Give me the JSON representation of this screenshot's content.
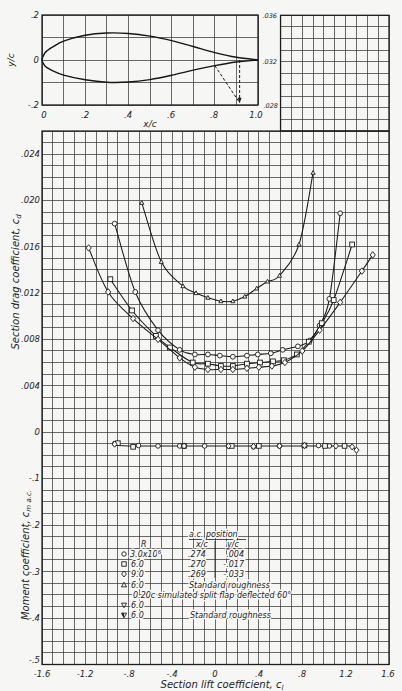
{
  "figure": {
    "airfoil": {
      "ylabel": "y/c",
      "xlabel": "x/c",
      "xticks": [
        "0",
        ".2",
        ".4",
        ".6",
        ".8",
        "1.0"
      ],
      "yticks": [
        ".2",
        "0",
        "-.2"
      ]
    },
    "extension_ticks": [
      ".036",
      ".032",
      ".028"
    ],
    "drag": {
      "ylabel": "Section drag coefficient, c",
      "ylabel_sub": "d",
      "yticks": [
        ".024",
        ".020",
        ".016",
        ".012",
        ".008",
        ".004",
        "0"
      ]
    },
    "moment": {
      "ylabel": "Moment coefficient, c",
      "ylabel_sub": "m a.c.",
      "yticks": [
        "-.1",
        "-.2",
        "-.3",
        "-.4",
        "-.5"
      ]
    },
    "xaxis": {
      "label": "Section lift coefficient, c",
      "label_sub": "l",
      "ticks": [
        "-1.6",
        "-1.2",
        "-.8",
        "-.4",
        "0",
        ".4",
        ".8",
        "1.2",
        "1.6"
      ]
    },
    "legend": {
      "header_ac": "a.c. position",
      "header_r": "R",
      "header_xc": "x/c",
      "header_yc": "y/c",
      "rows": [
        {
          "marker": "circle",
          "r": "3.0x10",
          "r_exp": "6",
          "xc": ".274",
          "yc": ".004"
        },
        {
          "marker": "square",
          "r": "6.0",
          "xc": ".270",
          "yc": "-.017"
        },
        {
          "marker": "diamond",
          "r": "9.0",
          "xc": ".269",
          "yc": "-.033"
        },
        {
          "marker": "triangle",
          "r": "6.0",
          "note": "Standard roughness"
        },
        {
          "note": "0.20c simulated split flap deflected 60°"
        },
        {
          "marker": "triangle-down",
          "r": "6.0"
        },
        {
          "marker": "triangle-down-flagged",
          "r": "6.0",
          "note": "Standard roughness"
        }
      ]
    }
  },
  "chart_data": [
    {
      "type": "line",
      "title": "Airfoil section",
      "xlabel": "x/c",
      "ylabel": "y/c",
      "xlim": [
        0,
        1.0
      ],
      "ylim": [
        -0.2,
        0.2
      ],
      "xticks": [
        0,
        0.2,
        0.4,
        0.6,
        0.8,
        1.0
      ],
      "yticks": [
        -0.2,
        0,
        0.2
      ],
      "grid": true,
      "series": [
        {
          "name": "upper surface",
          "points": [
            [
              0,
              0
            ],
            [
              0.0125,
              0.03
            ],
            [
              0.025,
              0.042
            ],
            [
              0.05,
              0.058
            ],
            [
              0.1,
              0.084
            ],
            [
              0.2,
              0.11
            ],
            [
              0.3,
              0.12
            ],
            [
              0.4,
              0.118
            ],
            [
              0.5,
              0.106
            ],
            [
              0.6,
              0.086
            ],
            [
              0.7,
              0.06
            ],
            [
              0.8,
              0.033
            ],
            [
              0.9,
              0.012
            ],
            [
              1.0,
              0
            ]
          ]
        },
        {
          "name": "lower surface",
          "points": [
            [
              0,
              0
            ],
            [
              0.0125,
              -0.025
            ],
            [
              0.025,
              -0.035
            ],
            [
              0.05,
              -0.048
            ],
            [
              0.1,
              -0.067
            ],
            [
              0.2,
              -0.088
            ],
            [
              0.3,
              -0.099
            ],
            [
              0.4,
              -0.098
            ],
            [
              0.5,
              -0.087
            ],
            [
              0.6,
              -0.068
            ],
            [
              0.7,
              -0.045
            ],
            [
              0.8,
              -0.025
            ],
            [
              0.9,
              -0.009
            ],
            [
              1.0,
              0
            ]
          ]
        },
        {
          "name": "split flap deflected 60 deg",
          "style": "dashed",
          "points": [
            [
              0.8,
              -0.025
            ],
            [
              0.915,
              -0.19
            ]
          ]
        },
        {
          "name": "flap reference",
          "style": "dashed-arrow",
          "points": [
            [
              0.915,
              0
            ],
            [
              0.915,
              -0.19
            ]
          ]
        }
      ]
    },
    {
      "type": "line",
      "title": "Section drag coefficient vs section lift coefficient",
      "xlabel": "Section lift coefficient, cl",
      "ylabel": "Section drag coefficient, cd",
      "xlim": [
        -1.6,
        1.6
      ],
      "ylim": [
        0,
        0.036
      ],
      "xticks": [
        -1.6,
        -1.2,
        -0.8,
        -0.4,
        0,
        0.4,
        0.8,
        1.2,
        1.6
      ],
      "yticks": [
        0,
        0.004,
        0.008,
        0.012,
        0.016,
        0.02,
        0.024,
        0.028,
        0.032,
        0.036
      ],
      "grid": true,
      "legend_position": "lower center (inside moment panel)",
      "series": [
        {
          "name": "R = 3.0x10^6",
          "marker": "circle",
          "points": [
            [
              -0.93,
              0.018
            ],
            [
              -0.74,
              0.0121
            ],
            [
              -0.53,
              0.0088
            ],
            [
              -0.33,
              0.0071
            ],
            [
              -0.19,
              0.0067
            ],
            [
              -0.07,
              0.0067
            ],
            [
              0.04,
              0.0066
            ],
            [
              0.16,
              0.0065
            ],
            [
              0.29,
              0.0066
            ],
            [
              0.39,
              0.0067
            ],
            [
              0.51,
              0.0068
            ],
            [
              0.62,
              0.0071
            ],
            [
              0.76,
              0.0074
            ],
            [
              0.87,
              0.0079
            ],
            [
              0.96,
              0.0092
            ],
            [
              1.05,
              0.0115
            ],
            [
              1.15,
              0.0189
            ]
          ]
        },
        {
          "name": "R = 6.0x10^6",
          "marker": "square",
          "points": [
            [
              -0.97,
              0.0132
            ],
            [
              -0.77,
              0.0105
            ],
            [
              -0.55,
              0.0083
            ],
            [
              -0.42,
              0.0073
            ],
            [
              -0.21,
              0.006
            ],
            [
              -0.07,
              0.0059
            ],
            [
              0.05,
              0.0057
            ],
            [
              0.16,
              0.0057
            ],
            [
              0.29,
              0.0059
            ],
            [
              0.41,
              0.006
            ],
            [
              0.53,
              0.0061
            ],
            [
              0.63,
              0.0062
            ],
            [
              0.75,
              0.0067
            ],
            [
              0.86,
              0.0078
            ],
            [
              0.98,
              0.0094
            ],
            [
              1.09,
              0.0114
            ],
            [
              1.26,
              0.0162
            ]
          ]
        },
        {
          "name": "R = 9.0x10^6",
          "marker": "diamond",
          "points": [
            [
              -1.17,
              0.0159
            ],
            [
              -0.99,
              0.0121
            ],
            [
              -0.76,
              0.0098
            ],
            [
              -0.53,
              0.008
            ],
            [
              -0.33,
              0.0064
            ],
            [
              -0.19,
              0.0056
            ],
            [
              -0.07,
              0.0054
            ],
            [
              0.05,
              0.0054
            ],
            [
              0.16,
              0.0054
            ],
            [
              0.29,
              0.0055
            ],
            [
              0.4,
              0.0056
            ],
            [
              0.52,
              0.0057
            ],
            [
              0.64,
              0.006
            ],
            [
              0.8,
              0.007
            ],
            [
              0.96,
              0.0088
            ],
            [
              1.15,
              0.0112
            ],
            [
              1.35,
              0.0139
            ],
            [
              1.45,
              0.0153
            ]
          ]
        },
        {
          "name": "R = 6.0x10^6, standard roughness",
          "marker": "triangle",
          "points": [
            [
              -0.68,
              0.0198
            ],
            [
              -0.5,
              0.0147
            ],
            [
              -0.3,
              0.0126
            ],
            [
              -0.18,
              0.012
            ],
            [
              -0.07,
              0.0116
            ],
            [
              0.05,
              0.0113
            ],
            [
              0.16,
              0.0113
            ],
            [
              0.27,
              0.0117
            ],
            [
              0.38,
              0.0124
            ],
            [
              0.48,
              0.013
            ],
            [
              0.59,
              0.0135
            ],
            [
              0.77,
              0.0162
            ],
            [
              0.9,
              0.0224
            ]
          ]
        }
      ]
    },
    {
      "type": "scatter",
      "title": "Moment coefficient about aerodynamic center vs section lift coefficient",
      "xlabel": "Section lift coefficient, cl",
      "ylabel": "Moment coefficient, cm a.c.",
      "xlim": [
        -1.6,
        1.6
      ],
      "ylim": [
        -0.5,
        0
      ],
      "yticks": [
        -0.5,
        -0.4,
        -0.3,
        -0.2,
        -0.1,
        0
      ],
      "grid": true,
      "series": [
        {
          "name": "R = 3.0x10^6",
          "marker": "circle",
          "points": [
            [
              -0.93,
              -0.025
            ],
            [
              -0.71,
              -0.029
            ],
            [
              -0.53,
              -0.03
            ],
            [
              -0.33,
              -0.03
            ],
            [
              -0.1,
              -0.03
            ],
            [
              0.12,
              -0.03
            ],
            [
              0.35,
              -0.032
            ],
            [
              0.59,
              -0.03
            ],
            [
              0.82,
              -0.029
            ],
            [
              0.95,
              -0.029
            ],
            [
              1.05,
              -0.03
            ]
          ]
        },
        {
          "name": "R = 6.0x10^6",
          "marker": "square",
          "points": [
            [
              -0.9,
              -0.024
            ],
            [
              -0.76,
              -0.032
            ],
            [
              -0.29,
              -0.03
            ],
            [
              0.15,
              -0.03
            ],
            [
              0.4,
              -0.03
            ],
            [
              0.82,
              -0.029
            ],
            [
              1.01,
              -0.03
            ],
            [
              1.19,
              -0.03
            ]
          ]
        },
        {
          "name": "R = 9.0x10^6",
          "marker": "diamond",
          "points": [
            [
              -0.93,
              -0.026
            ],
            [
              -0.29,
              -0.03
            ],
            [
              0.12,
              -0.03
            ],
            [
              0.35,
              -0.031
            ],
            [
              0.59,
              -0.03
            ],
            [
              0.82,
              -0.029
            ],
            [
              1.11,
              -0.03
            ],
            [
              1.26,
              -0.032
            ],
            [
              1.3,
              -0.039
            ]
          ]
        }
      ],
      "fair_line": [
        [
          -0.95,
          -0.026
        ],
        [
          -0.8,
          -0.03
        ],
        [
          0.0,
          -0.03
        ],
        [
          1.15,
          -0.03
        ],
        [
          1.25,
          -0.032
        ],
        [
          1.3,
          -0.039
        ]
      ]
    }
  ]
}
